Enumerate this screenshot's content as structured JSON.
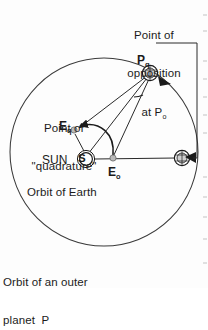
{
  "figure": {
    "captions": {
      "opposition_line1": "Point of",
      "opposition_line2": "opposition",
      "opposition_line3_prefix": "at P",
      "opposition_line3_sub": "o",
      "quadrature_line1": "Point of",
      "quadrature_line2": "\"quadrature\"",
      "earth_orbit": "Orbit of Earth",
      "outer_orbit_line1": "Orbit of an outer",
      "outer_orbit_line2": "planet  P"
    },
    "labels": {
      "planet_quadrature": "P",
      "planet_quadrature_sub": "q",
      "earth_quadrature": "E",
      "earth_quadrature_sub": "q",
      "sun_word": "SUN",
      "sun_symbol": "S",
      "earth_opposition": "E",
      "earth_opposition_sub": "o"
    },
    "colors": {
      "ink": "#1b1b1b",
      "line": "#2a2a2a",
      "orbit": "#3a3a3a",
      "body_fill": "#b9b9b9",
      "paper": "#fdfdfd"
    },
    "geometry": {
      "outer_orbit_center_x": 104,
      "outer_orbit_center_y": 152,
      "outer_orbit_radius": 94,
      "sun_x": 86,
      "sun_y": 159,
      "earth_orbit_radius": 27,
      "earth_opposition_x": 113,
      "earth_opposition_y": 159,
      "earth_quadrature_x": 73,
      "earth_quadrature_y": 131,
      "planet_quadrature_x": 150,
      "planet_quadrature_y": 73,
      "planet_opposition_x": 182,
      "planet_opposition_y": 158,
      "bracket_right_x": 197,
      "bracket_top_y": 43
    }
  }
}
